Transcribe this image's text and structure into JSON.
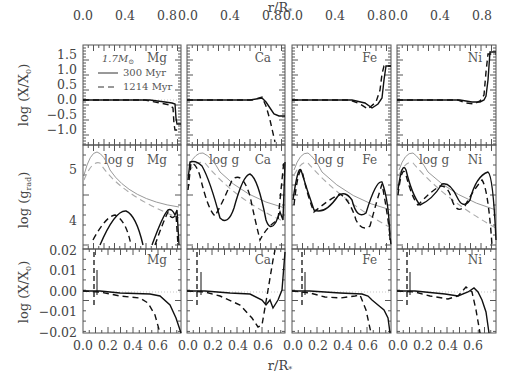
{
  "chart_data": {
    "type": "line",
    "layout": "3x4 grid of panels (rows: abundance, radiative acceleration, abundance zoom; columns: elements)",
    "top_axis_label": "r/R*",
    "bottom_axis_label": "r/R*",
    "top_x_ticks": [
      "0.0",
      "0.4",
      "0.8"
    ],
    "bottom_x_ticks": [
      "0.0",
      "0.2",
      "0.4",
      "0.6"
    ],
    "columns": [
      "Mg",
      "Ca",
      "Fe",
      "Ni"
    ],
    "rows": [
      {
        "ylabel": "log (X/X0)",
        "yticks": [
          "1.5",
          "1.0",
          "0.5",
          "0.0",
          "−0.5",
          "−1.0"
        ],
        "ylim": [
          -1.3,
          1.85
        ],
        "xlim": [
          0,
          0.95
        ]
      },
      {
        "ylabel": "log (g_rad)",
        "yticks": [
          "5",
          "4"
        ],
        "ylim": [
          3.55,
          5.5
        ],
        "xlim": [
          0,
          0.95
        ],
        "annotation": "log g"
      },
      {
        "ylabel": "log (X/X0)",
        "yticks": [
          "0.02",
          "0.01",
          "0.00",
          "−0.01",
          "−0.02"
        ],
        "ylim": [
          -0.02,
          0.02
        ],
        "xlim": [
          0,
          0.78
        ]
      }
    ],
    "legend": {
      "mass": "1.7 M☉",
      "entries": [
        {
          "label": "300 Myr",
          "style": "solid"
        },
        {
          "label": "1214 Myr",
          "style": "dashed"
        }
      ]
    },
    "series": [
      {
        "name": "300 Myr",
        "style": "solid"
      },
      {
        "name": "1214 Myr",
        "style": "dashed"
      },
      {
        "name": "log g (300 Myr)",
        "style": "solid-gray"
      },
      {
        "name": "log g (1214 Myr)",
        "style": "dashed-gray"
      }
    ]
  },
  "labels": {
    "top_axis": "r/R",
    "bottom_axis": "r/R",
    "star_sub": "*",
    "row1_ylabel": "log (X/X",
    "row2_ylabel": "log (g",
    "row2_sub": "rad",
    "row3_ylabel": "log (X/X",
    "zero_sub": "0",
    "legend_mass": "1.7M",
    "legend_sun": "⊙",
    "legend_solid": "300 Myr",
    "legend_dashed": "1214 Myr",
    "logg": "log g",
    "el_mg": "Mg",
    "el_ca": "Ca",
    "el_fe": "Fe",
    "el_ni": "Ni"
  },
  "ticks": {
    "top": [
      "0.0",
      "0.4",
      "0.8"
    ],
    "bottom": [
      "0.0",
      "0.2",
      "0.4",
      "0.6"
    ],
    "row1": [
      "1.5",
      "1.0",
      "0.5",
      "0.0",
      "−0.5",
      "−1.0"
    ],
    "row2": [
      "5",
      "4"
    ],
    "row3": [
      "0.02",
      "0.01",
      "0.00",
      "−0.01",
      "−0.02"
    ]
  }
}
